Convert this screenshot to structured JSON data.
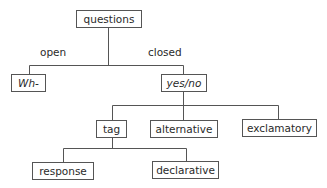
{
  "diagram": {
    "type": "tree",
    "nodes": {
      "questions": {
        "label": "questions",
        "italic": false
      },
      "wh": {
        "label": "Wh-",
        "italic": true
      },
      "yesno": {
        "label": "yes/no",
        "italic": true
      },
      "tag": {
        "label": "tag",
        "italic": false
      },
      "alternative": {
        "label": "alternative",
        "italic": false
      },
      "exclamatory": {
        "label": "exclamatory",
        "italic": false
      },
      "response": {
        "label": "response",
        "italic": false
      },
      "declarative": {
        "label": "declarative",
        "italic": false
      }
    },
    "edge_labels": {
      "open": "open",
      "closed": "closed"
    },
    "edges": [
      {
        "from": "questions",
        "to": "wh",
        "label": "open"
      },
      {
        "from": "questions",
        "to": "yesno",
        "label": "closed"
      },
      {
        "from": "yesno",
        "to": "tag"
      },
      {
        "from": "yesno",
        "to": "alternative"
      },
      {
        "from": "yesno",
        "to": "exclamatory"
      },
      {
        "from": "tag",
        "to": "response"
      },
      {
        "from": "tag",
        "to": "declarative"
      }
    ],
    "colors": {
      "line": "#555555",
      "text": "#2a2a2a",
      "background": "#ffffff"
    }
  }
}
